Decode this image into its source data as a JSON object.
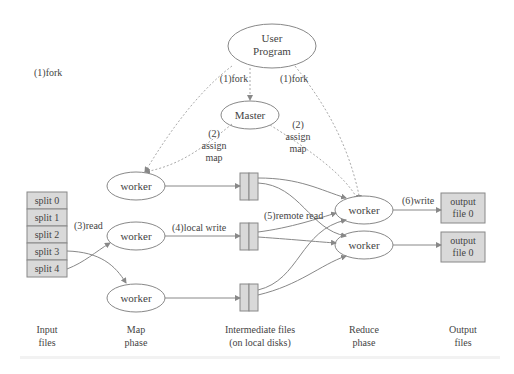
{
  "nodes": {
    "user_program": [
      "User",
      "Program"
    ],
    "master": "Master",
    "worker": "worker"
  },
  "splits": [
    "split 0",
    "split 1",
    "split 2",
    "split 3",
    "split 4"
  ],
  "outputs": [
    [
      "output",
      "file 0"
    ],
    [
      "output",
      "file 0"
    ]
  ],
  "edge_labels": {
    "fork": "(1)fork",
    "assign_num": "(2)",
    "assign": "assign",
    "map": "map",
    "read": "(3)read",
    "local_write": "(4)local write",
    "remote_read": "(5)remote read",
    "write": "(6)write"
  },
  "phases": [
    [
      "Input",
      "files"
    ],
    [
      "Map",
      "phase"
    ],
    [
      "Intermediate files",
      "(on local disks)"
    ],
    [
      "Reduce",
      "phase"
    ],
    [
      "Output",
      "files"
    ]
  ],
  "colors": {
    "line": "#888888",
    "box_fill": "#d9d9d9",
    "text": "#444444",
    "dotted": "#aaaaaa"
  }
}
